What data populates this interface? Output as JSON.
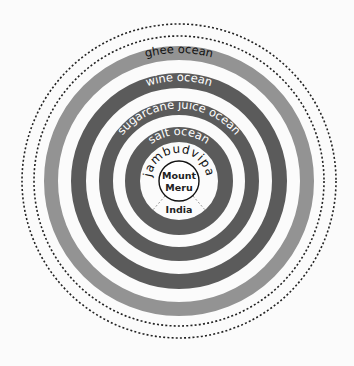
{
  "diagram": {
    "center": {
      "label_line1": "Mount",
      "label_line2": "Meru"
    },
    "region": {
      "label": "India"
    },
    "continent": {
      "label": "jambudvipa"
    },
    "oceans": [
      {
        "label": "salt ocean",
        "color": "#5b5b5b",
        "text_color": "#ffffff"
      },
      {
        "label": "sugarcane juice ocean",
        "color": "#5b5b5b",
        "text_color": "#ffffff"
      },
      {
        "label": "wine ocean",
        "color": "#5b5b5b",
        "text_color": "#ffffff"
      },
      {
        "label": "ghee ocean",
        "color": "#939393",
        "text_color": "#111111"
      }
    ],
    "outer_boundaries": [
      {
        "style": "dotted"
      },
      {
        "style": "dotted"
      }
    ]
  }
}
